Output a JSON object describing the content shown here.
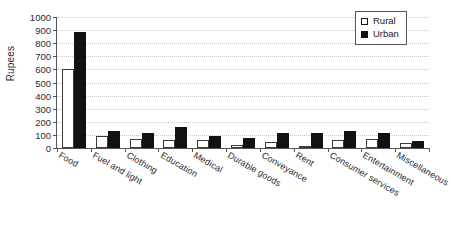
{
  "chart_data": {
    "type": "bar",
    "title": "",
    "xlabel": "",
    "ylabel": "Rupees",
    "ylim": [
      0,
      1000
    ],
    "ytick_step": 100,
    "yticks": [
      1000,
      900,
      800,
      700,
      600,
      500,
      400,
      300,
      200,
      100,
      0
    ],
    "grid": true,
    "legend_position": "top-right",
    "categories": [
      "Food",
      "Fuel and light",
      "Clothing",
      "Education",
      "Medical",
      "Durable goods",
      "Conveyance",
      "Rent",
      "Consumer services",
      "Entertainment",
      "Miscellaneous"
    ],
    "series": [
      {
        "name": "Rural",
        "color": "#ffffff",
        "values": [
          600,
          90,
          72,
          65,
          62,
          20,
          48,
          10,
          58,
          68,
          40
        ]
      },
      {
        "name": "Urban",
        "color": "#111111",
        "values": [
          885,
          132,
          118,
          160,
          95,
          75,
          118,
          118,
          130,
          118,
          55
        ]
      }
    ]
  },
  "legend": {
    "items": [
      {
        "label": "Rural",
        "swatch": "hollow-square"
      },
      {
        "label": "Urban",
        "swatch": "filled-square"
      }
    ]
  },
  "axis": {
    "y_title": "Rupees"
  }
}
